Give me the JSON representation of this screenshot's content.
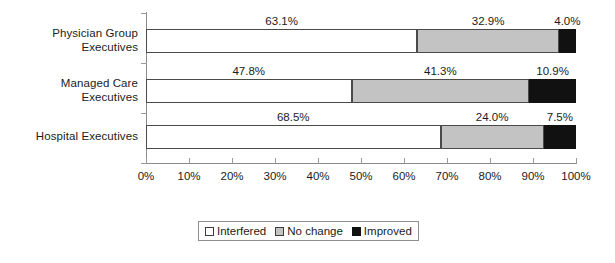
{
  "chart_data": {
    "type": "bar",
    "orientation": "horizontal",
    "stacked": true,
    "stacked_percent": true,
    "title": "",
    "subtitle": "",
    "xlabel": "",
    "ylabel": "",
    "xlim": [
      0,
      100
    ],
    "grid": false,
    "legend_position": "bottom",
    "categories": [
      "Physician Group\nExecutives",
      "Managed Care\nExecutives",
      "Hospital Executives"
    ],
    "xticks": [
      "0%",
      "10%",
      "20%",
      "30%",
      "40%",
      "50%",
      "60%",
      "70%",
      "80%",
      "90%",
      "100%"
    ],
    "xtick_values": [
      0,
      10,
      20,
      30,
      40,
      50,
      60,
      70,
      80,
      90,
      100
    ],
    "series": [
      {
        "name": "Interfered",
        "color": "#ffffff",
        "values": [
          63.1,
          47.8,
          68.5
        ],
        "labels": [
          "63.1%",
          "47.8%",
          "68.5%"
        ]
      },
      {
        "name": "No change",
        "color": "#c3c3c3",
        "values": [
          32.9,
          41.3,
          24.0
        ],
        "labels": [
          "32.9%",
          "41.3%",
          "24.0%"
        ]
      },
      {
        "name": "Improved",
        "color": "#111111",
        "values": [
          4.0,
          10.9,
          7.5
        ],
        "labels": [
          "4.0%",
          "10.9%",
          "7.5%"
        ]
      }
    ]
  },
  "legend": {
    "items": [
      {
        "label": "Interfered"
      },
      {
        "label": "No change"
      },
      {
        "label": "Improved"
      }
    ]
  }
}
